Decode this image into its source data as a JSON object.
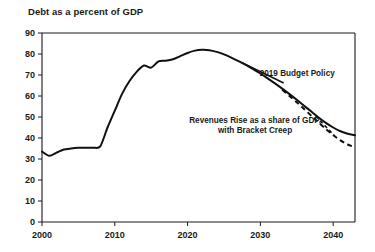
{
  "chart_data": {
    "type": "line",
    "title": "Debt as a percent of GDP",
    "xlabel": "",
    "ylabel": "",
    "xlim": [
      2000,
      2043
    ],
    "ylim": [
      0,
      90
    ],
    "grid": false,
    "legend_position": "inline-annotation",
    "xticks": [
      "2000",
      "2010",
      "2020",
      "2030",
      "2040"
    ],
    "xtick_values": [
      2000,
      2010,
      2020,
      2030,
      2040
    ],
    "yticks": [
      "0",
      "10",
      "20",
      "30",
      "40",
      "50",
      "60",
      "70",
      "80",
      "90"
    ],
    "ytick_values": [
      0,
      10,
      20,
      30,
      40,
      50,
      60,
      70,
      80,
      90
    ],
    "annotations": [
      {
        "text": "2019 Budget Policy",
        "x": 2035,
        "y": 71
      },
      {
        "text": "Revenues Rise as a share of GDP,",
        "x": 2029,
        "y": 47
      },
      {
        "text": "with Bracket Creep",
        "x": 2029,
        "y": 43
      }
    ],
    "series": [
      {
        "name": "2019 Budget Policy",
        "style": "solid",
        "x": [
          2000,
          2001,
          2002,
          2003,
          2004,
          2005,
          2006,
          2007,
          2008,
          2009,
          2010,
          2011,
          2012,
          2013,
          2014,
          2015,
          2016,
          2017,
          2018,
          2019,
          2020,
          2021,
          2022,
          2023,
          2024,
          2025,
          2026,
          2027,
          2028,
          2029,
          2030,
          2031,
          2032,
          2033,
          2034,
          2035,
          2036,
          2037,
          2038,
          2039,
          2040,
          2041,
          2042,
          2043
        ],
        "values": [
          33.5,
          31.5,
          33.0,
          34.5,
          35.0,
          35.3,
          35.4,
          35.4,
          36.0,
          45.0,
          53.0,
          61.0,
          67.0,
          71.5,
          74.5,
          73.5,
          76.5,
          76.8,
          77.5,
          79.0,
          80.5,
          81.6,
          82.0,
          81.8,
          81.0,
          79.8,
          78.3,
          76.6,
          74.8,
          72.8,
          70.7,
          68.4,
          66.0,
          63.5,
          60.9,
          58.2,
          55.4,
          52.6,
          49.8,
          47.2,
          45.0,
          43.2,
          42.0,
          41.3
        ]
      },
      {
        "name": "Revenues Rise as a share of GDP, with Bracket Creep",
        "style": "dashed",
        "x": [
          2033,
          2034,
          2035,
          2036,
          2037,
          2038,
          2039,
          2040,
          2041,
          2042,
          2043
        ],
        "values": [
          63.0,
          60.0,
          57.0,
          53.8,
          50.6,
          47.4,
          44.3,
          41.4,
          38.9,
          36.9,
          35.6
        ]
      }
    ]
  }
}
